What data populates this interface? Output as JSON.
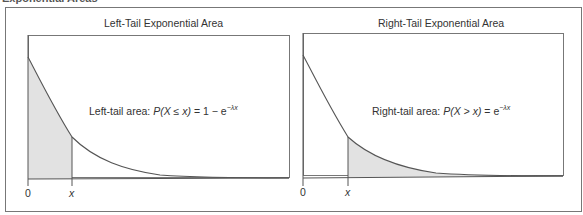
{
  "figure": {
    "cropped_caption": "Exponential Areas",
    "fill_color": "#e2e2e2",
    "line_color": "#555555"
  },
  "left_panel": {
    "title": "Left-Tail Exponential Area",
    "formula_label": "Left-tail area: ",
    "formula_lhs": "P(X ≤ x)",
    "formula_rhs": " = 1 − e",
    "formula_exponent": "−λx",
    "tick_zero": "0",
    "tick_x": "x",
    "shaded_region": "0 to x"
  },
  "right_panel": {
    "title": "Right-Tail Exponential Area",
    "formula_label": "Right-tail area: ",
    "formula_lhs": "P(X > x)",
    "formula_rhs": " = e",
    "formula_exponent": "−λx",
    "tick_zero": "0",
    "tick_x": "x",
    "shaded_region": "x to ∞"
  }
}
